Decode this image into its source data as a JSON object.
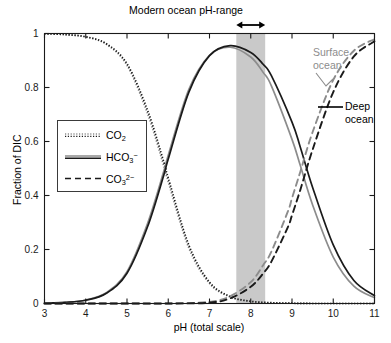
{
  "chart_data": {
    "type": "line",
    "title": "Modern ocean pH-range",
    "xlabel": "pH (total scale)",
    "ylabel": "Fraction of DIC",
    "xlim": [
      3,
      11
    ],
    "ylim": [
      0,
      1
    ],
    "xticks": [
      "3",
      "4",
      "5",
      "6",
      "7",
      "8",
      "9",
      "10",
      "11"
    ],
    "xtick_values": [
      3,
      4,
      5,
      6,
      7,
      8,
      9,
      10,
      11
    ],
    "yticks": [
      "0",
      "0.2",
      "0.4",
      "0.6",
      "0.8",
      "1"
    ],
    "ytick_values": [
      0,
      0.2,
      0.4,
      0.6,
      0.8,
      1
    ],
    "grid": false,
    "legend_position": "center-left",
    "series": [
      {
        "name": "CO2",
        "label_html": "CO<sub>2</sub>",
        "style": "dotted",
        "color": "#1a1a1a",
        "conditions": [
          "surface ocean",
          "deep ocean"
        ],
        "comment": "fraction of CO2(aq) vs pH, both surface (gray) and deep (black) overlap",
        "x": [
          3.0,
          3.5,
          4.0,
          4.5,
          5.0,
          5.5,
          5.9,
          6.0,
          6.5,
          7.0,
          7.5,
          8.0,
          8.5,
          9.0,
          9.5,
          10.0,
          10.5,
          11.0
        ],
        "y_deep": [
          0.999,
          0.996,
          0.988,
          0.962,
          0.888,
          0.715,
          0.52,
          0.465,
          0.216,
          0.079,
          0.026,
          0.008,
          0.003,
          0.001,
          0.0,
          0.0,
          0.0,
          0.0
        ],
        "y_surface": [
          0.999,
          0.996,
          0.987,
          0.96,
          0.882,
          0.702,
          0.505,
          0.45,
          0.205,
          0.074,
          0.024,
          0.008,
          0.002,
          0.001,
          0.0,
          0.0,
          0.0,
          0.0
        ]
      },
      {
        "name": "HCO3-",
        "label_html": "HCO<sub>3</sub><sup>&minus;</sup>",
        "style": "solid",
        "color": "#1a1a1a",
        "conditions": [
          "surface ocean",
          "deep ocean"
        ],
        "comment": "bicarbonate fraction, peaks ~0.955 near pH 7.5",
        "x": [
          3.0,
          3.5,
          4.0,
          4.5,
          5.0,
          5.5,
          5.9,
          6.0,
          6.5,
          7.0,
          7.5,
          8.0,
          8.3,
          8.5,
          9.0,
          9.2,
          9.5,
          10.0,
          10.5,
          11.0
        ],
        "y_deep": [
          0.001,
          0.004,
          0.012,
          0.038,
          0.112,
          0.285,
          0.48,
          0.535,
          0.783,
          0.918,
          0.955,
          0.93,
          0.886,
          0.844,
          0.672,
          0.58,
          0.43,
          0.217,
          0.085,
          0.029
        ],
        "y_surface": [
          0.001,
          0.004,
          0.013,
          0.04,
          0.118,
          0.297,
          0.494,
          0.549,
          0.793,
          0.919,
          0.949,
          0.913,
          0.856,
          0.806,
          0.608,
          0.512,
          0.365,
          0.172,
          0.064,
          0.021
        ]
      },
      {
        "name": "CO3 2-",
        "label_html": "CO<sub>3</sub><sup>2&minus;</sup>",
        "style": "dashed",
        "color": "#1a1a1a",
        "conditions": [
          "surface ocean",
          "deep ocean"
        ],
        "comment": "carbonate fraction, rises steeply after pH 8",
        "x": [
          3.0,
          4.0,
          5.0,
          6.0,
          7.0,
          7.5,
          8.0,
          8.3,
          8.5,
          8.9,
          9.0,
          9.2,
          9.5,
          10.0,
          10.5,
          11.0
        ],
        "y_deep": [
          0.0,
          0.0,
          0.0,
          0.0,
          0.003,
          0.019,
          0.062,
          0.111,
          0.155,
          0.283,
          0.327,
          0.42,
          0.57,
          0.783,
          0.915,
          0.971
        ],
        "y_surface": [
          0.0,
          0.0,
          0.0,
          0.0,
          0.006,
          0.027,
          0.079,
          0.142,
          0.192,
          0.341,
          0.39,
          0.487,
          0.635,
          0.828,
          0.936,
          0.979
        ]
      }
    ],
    "shaded_band": {
      "label": "Modern ocean pH-range",
      "x_start": 7.65,
      "x_end": 8.35,
      "color": "#c9c9c9"
    },
    "annotations": [
      {
        "name": "surface-ocean",
        "text_line1": "Surface",
        "text_line2": "ocean",
        "color": "#8c8c8c"
      },
      {
        "name": "deep-ocean",
        "text_line1": "Deep",
        "text_line2": "ocean",
        "color": "#000000"
      }
    ],
    "colors": {
      "deep": "#1a1a1a",
      "surface": "#8c8c8c",
      "band": "#c9c9c9",
      "axis": "#1a1a1a"
    }
  },
  "figure": {
    "title": "Modern ocean pH-range",
    "xlabel": "pH (total scale)",
    "ylabel": "Fraction of DIC",
    "xticks": [
      "3",
      "4",
      "5",
      "6",
      "7",
      "8",
      "9",
      "10",
      "11"
    ],
    "yticks": [
      "0",
      "0.2",
      "0.4",
      "0.6",
      "0.8",
      "1"
    ],
    "legend": [
      {
        "key": "co2",
        "style": "dotted"
      },
      {
        "key": "hco3",
        "style": "solid"
      },
      {
        "key": "co3",
        "style": "dashed"
      }
    ],
    "annotations": {
      "surface_line1": "Surface",
      "surface_line2": "ocean",
      "deep_line1": "Deep",
      "deep_line2": "ocean"
    }
  }
}
